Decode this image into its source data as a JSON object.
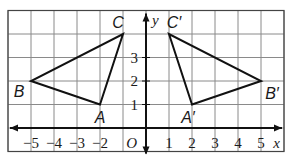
{
  "diagram": {
    "type": "coordinate-plane-reflection",
    "grid": {
      "x_min": -6,
      "x_max": 6,
      "y_min": -1,
      "y_max": 5
    },
    "axes": {
      "x_label": "x",
      "y_label": "y",
      "origin_label": "O",
      "x_ticks": [
        "-5",
        "-4",
        "-3",
        "-2",
        "1",
        "2",
        "3",
        "4",
        "5"
      ],
      "y_ticks": [
        "1",
        "2",
        "3"
      ]
    },
    "triangles": [
      {
        "name": "ABC",
        "vertices": [
          {
            "label": "A",
            "x": -2,
            "y": 1
          },
          {
            "label": "B",
            "x": -5,
            "y": 2
          },
          {
            "label": "C",
            "x": -1,
            "y": 4
          }
        ]
      },
      {
        "name": "A'B'C'",
        "vertices": [
          {
            "label": "A′",
            "x": 2,
            "y": 1
          },
          {
            "label": "B′",
            "x": 5,
            "y": 2
          },
          {
            "label": "C′",
            "x": 1,
            "y": 4
          }
        ]
      }
    ],
    "colors": {
      "grid": "#8a8a8a",
      "axes": "#111111",
      "triangle": "#111111"
    }
  }
}
